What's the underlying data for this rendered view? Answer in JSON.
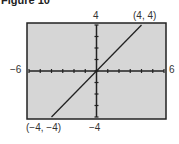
{
  "title": "Figure 10",
  "chart_data": {
    "type": "line",
    "title": "Figure 10",
    "xlim": [
      -6,
      6
    ],
    "ylim": [
      -4,
      4
    ],
    "x_tick_step": 1,
    "y_tick_step": 1,
    "grid": false,
    "background": "#d4d4d4",
    "series": [
      {
        "name": "y = x",
        "x": [
          -4,
          4
        ],
        "y": [
          -4,
          4
        ]
      }
    ],
    "annotations": [
      {
        "text": "(4, 4)",
        "x": 4,
        "y": 4
      },
      {
        "text": "(-4, -4)",
        "x": -4,
        "y": -4
      }
    ],
    "axis_labels": {
      "xmin": "−6",
      "xmax": "6",
      "ymax": "4",
      "ymin": "−4"
    }
  },
  "labels": {
    "xmin": "−6",
    "xmax": "6",
    "ymax": "4",
    "ymin": "−4",
    "pt_top": "(4, 4)",
    "pt_bottom": "(−4, −4)"
  }
}
